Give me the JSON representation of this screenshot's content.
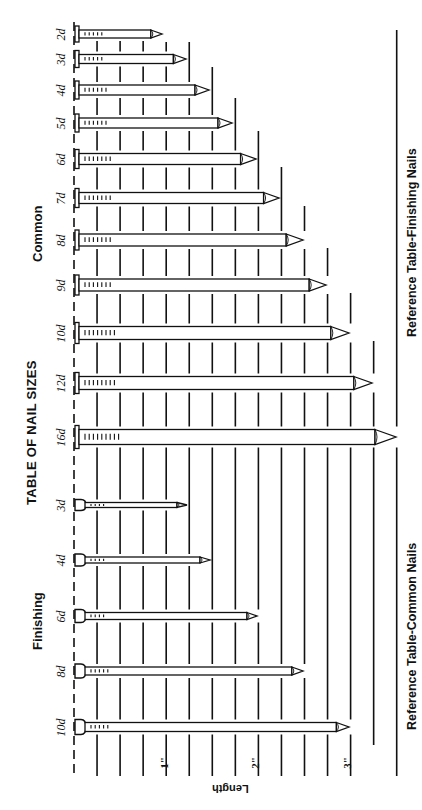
{
  "title": "TABLE OF NAIL SIZES",
  "sections": {
    "common": "Common",
    "finishing": "Finishing"
  },
  "references": {
    "top": "Reference Table-Finishing Nails",
    "bottom": "Reference Table-Common Nails"
  },
  "axis": {
    "label": "Length",
    "ticks": [
      "1\"",
      "2\"",
      "3\""
    ]
  },
  "colors": {
    "ink": "#111111",
    "paper": "#ffffff"
  },
  "chart_data": {
    "type": "bar",
    "title": "TABLE OF NAIL SIZES",
    "xlabel": "Length",
    "ylabel": "",
    "unit": "inches",
    "grid_step": 0.25,
    "xlim": [
      0,
      3.5
    ],
    "series": [
      {
        "name": "Common",
        "categories": [
          "2d",
          "3d",
          "4d",
          "5d",
          "6d",
          "7d",
          "8d",
          "9d",
          "10d",
          "12d",
          "16d"
        ],
        "values": [
          1.0,
          1.25,
          1.5,
          1.75,
          2.0,
          2.25,
          2.5,
          2.75,
          3.0,
          3.25,
          3.5
        ]
      },
      {
        "name": "Finishing",
        "categories": [
          "3d",
          "4d",
          "6d",
          "8d",
          "10d"
        ],
        "values": [
          1.25,
          1.5,
          2.0,
          2.5,
          3.0
        ]
      }
    ],
    "annotations": [
      "Reference Table-Finishing Nails",
      "Reference Table-Common Nails"
    ]
  },
  "nails": {
    "common": [
      {
        "label": "2d",
        "y": 34,
        "tip": 162,
        "w": 8,
        "head": "flat"
      },
      {
        "label": "3d",
        "y": 59,
        "tip": 186,
        "w": 9,
        "head": "flat"
      },
      {
        "label": "4d",
        "y": 90,
        "tip": 209,
        "w": 10,
        "head": "flat"
      },
      {
        "label": "5d",
        "y": 123,
        "tip": 232,
        "w": 10,
        "head": "flat"
      },
      {
        "label": "6d",
        "y": 159,
        "tip": 256,
        "w": 11,
        "head": "flat"
      },
      {
        "label": "7d",
        "y": 198,
        "tip": 279,
        "w": 11,
        "head": "flat"
      },
      {
        "label": "8d",
        "y": 240,
        "tip": 303,
        "w": 12,
        "head": "flat"
      },
      {
        "label": "9d",
        "y": 285,
        "tip": 326,
        "w": 12,
        "head": "flat"
      },
      {
        "label": "10d",
        "y": 333,
        "tip": 349,
        "w": 13,
        "head": "flat"
      },
      {
        "label": "12d",
        "y": 383,
        "tip": 372,
        "w": 13,
        "head": "flat"
      },
      {
        "label": "16d",
        "y": 437,
        "tip": 396,
        "w": 15,
        "head": "flat"
      }
    ],
    "finishing": [
      {
        "label": "3d",
        "y": 505,
        "tip": 187,
        "w": 5,
        "head": "cup"
      },
      {
        "label": "4d",
        "y": 560,
        "tip": 210,
        "w": 6,
        "head": "cup"
      },
      {
        "label": "6d",
        "y": 616,
        "tip": 257,
        "w": 7,
        "head": "cup"
      },
      {
        "label": "8d",
        "y": 671,
        "tip": 303,
        "w": 8,
        "head": "cup"
      },
      {
        "label": "10d",
        "y": 727,
        "tip": 349,
        "w": 9,
        "head": "cup"
      }
    ]
  }
}
